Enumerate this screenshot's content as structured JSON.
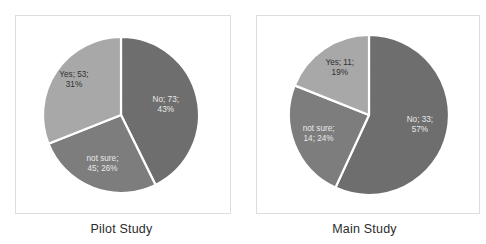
{
  "chart_data": [
    {
      "type": "pie",
      "title": "Pilot Study",
      "categories": [
        "No",
        "not sure",
        "Yes"
      ],
      "values": [
        73,
        45,
        53
      ],
      "percents": [
        43,
        26,
        31
      ],
      "total": 171,
      "labels": [
        {
          "line1": "No; 73;",
          "line2": "43%"
        },
        {
          "line1": "not sure;",
          "line2": "45; 26%"
        },
        {
          "line1": "Yes; 53;",
          "line2": "31%"
        }
      ],
      "colors": [
        "#6e6e6e",
        "#7d7d7d",
        "#a8a8a8"
      ],
      "legend": "none",
      "grid": false,
      "start_angle_deg": 0,
      "direction": "clockwise"
    },
    {
      "type": "pie",
      "title": "Main Study",
      "categories": [
        "No",
        "not sure",
        "Yes"
      ],
      "values": [
        33,
        14,
        11
      ],
      "percents": [
        57,
        24,
        19
      ],
      "total": 58,
      "labels": [
        {
          "line1": "No; 33;",
          "line2": "57%"
        },
        {
          "line1": "not sure;",
          "line2": "14; 24%"
        },
        {
          "line1": "Yes; 11;",
          "line2": "19%"
        }
      ],
      "colors": [
        "#6e6e6e",
        "#7d7d7d",
        "#a8a8a8"
      ],
      "legend": "none",
      "grid": false,
      "start_angle_deg": 0,
      "direction": "clockwise"
    }
  ],
  "panels": [
    {
      "caption": "Pilot Study",
      "chart_index": 0
    },
    {
      "caption": "Main Study",
      "chart_index": 1
    }
  ],
  "style": {
    "background": "#ffffff",
    "frame_border": "#dedede",
    "slice_gap": "#ffffff",
    "caption_color": "#2b2b2b",
    "label_dark_text": "#2f2f2f",
    "label_light_text": "#e9e9e9"
  }
}
